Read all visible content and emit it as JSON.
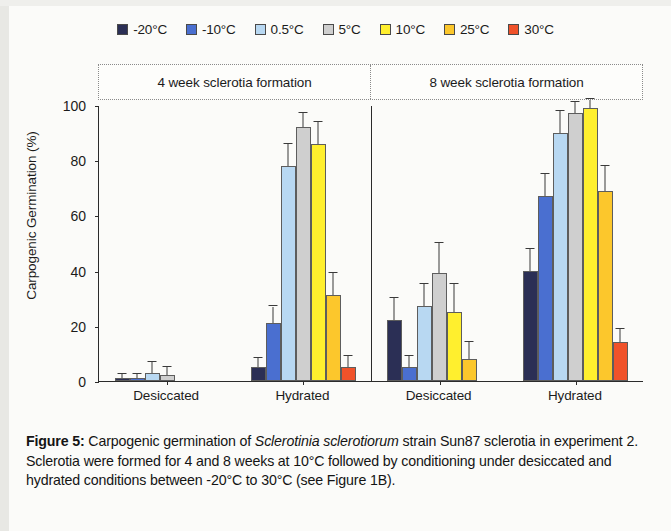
{
  "figure": {
    "label": "Figure 5:",
    "caption_part1": " Carpogenic germination of ",
    "caption_italic": "Sclerotinia sclerotiorum",
    "caption_part2": " strain Sun87 sclerotia in experiment 2. Sclerotia were formed for 4 and 8 weeks at 10°C followed by conditioning under desiccated and hydrated conditions between -20°C to 30°C (see Figure 1B)."
  },
  "chart_data": {
    "type": "bar",
    "title": "",
    "xlabel": "",
    "ylabel": "Carpogenic Germination (%)",
    "ylim": [
      0,
      100
    ],
    "yticks": [
      0,
      20,
      40,
      60,
      80,
      100
    ],
    "grid": false,
    "legend_position": "top-center",
    "panels": [
      {
        "header": "4 week sclerotia formation",
        "categories": [
          "Desiccated",
          "Hydrated"
        ]
      },
      {
        "header": "8 week sclerotia formation",
        "categories": [
          "Desiccated",
          "Hydrated"
        ]
      }
    ],
    "categories": [
      "Desiccated",
      "Hydrated",
      "Desiccated",
      "Hydrated"
    ],
    "series": [
      {
        "name": "-20°C",
        "color": "#2b2f55",
        "values": [
          1,
          5,
          22,
          40
        ],
        "errors": [
          1.5,
          3.5,
          8,
          8
        ]
      },
      {
        "name": "-10°C",
        "color": "#4a6fd0",
        "values": [
          1,
          21,
          5,
          67
        ],
        "errors": [
          1.5,
          6,
          4,
          8
        ]
      },
      {
        "name": "0.5°C",
        "color": "#b8d8f2",
        "values": [
          3,
          78,
          27,
          90
        ],
        "errors": [
          4,
          8,
          8,
          8
        ]
      },
      {
        "name": "5°C",
        "color": "#cfcfcf",
        "values": [
          2,
          92,
          39,
          97
        ],
        "errors": [
          3,
          5,
          11,
          4
        ]
      },
      {
        "name": "10°C",
        "color": "#ffef2e",
        "values": [
          0,
          86,
          25,
          99
        ],
        "errors": [
          0,
          8,
          10,
          3
        ]
      },
      {
        "name": "25°C",
        "color": "#fcc72c",
        "values": [
          0,
          31,
          8,
          69
        ],
        "errors": [
          0,
          8,
          6,
          9
        ]
      },
      {
        "name": "30°C",
        "color": "#f0522a",
        "values": [
          0,
          5,
          0,
          14
        ],
        "errors": [
          0,
          4,
          0,
          5
        ]
      }
    ]
  }
}
